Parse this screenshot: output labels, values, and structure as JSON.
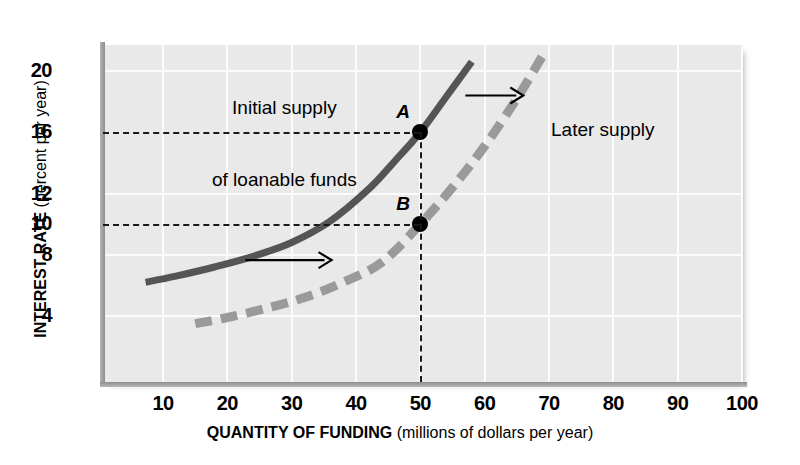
{
  "chart_data": {
    "type": "line",
    "title": "",
    "xlabel_bold": "QUANTITY OF FUNDING",
    "xlabel_rest": " (millions of dollars per year)",
    "ylabel_bold": "INTEREST RATE",
    "ylabel_rest": " (percent per year)",
    "xlim": [
      0,
      100
    ],
    "ylim": [
      0,
      22
    ],
    "xticks": [
      10,
      20,
      30,
      40,
      50,
      60,
      70,
      80,
      90,
      100
    ],
    "yticks": [
      20,
      16,
      12,
      10,
      8,
      4
    ],
    "y_gridlines": [
      20,
      12,
      8,
      4
    ],
    "x_gridlines": [
      10,
      20,
      30,
      40,
      50,
      60,
      70,
      80,
      90,
      100
    ],
    "grid": true,
    "legend": "none",
    "series": [
      {
        "name": "Initial supply of loanable funds",
        "style": "solid",
        "color": "#555555",
        "points": [
          {
            "x": 7.3,
            "y": 6.2
          },
          {
            "x": 12,
            "y": 6.6
          },
          {
            "x": 18,
            "y": 7.2
          },
          {
            "x": 24,
            "y": 7.9
          },
          {
            "x": 30,
            "y": 8.8
          },
          {
            "x": 36,
            "y": 10.2
          },
          {
            "x": 42,
            "y": 12.3
          },
          {
            "x": 46,
            "y": 14.1
          },
          {
            "x": 50,
            "y": 16.0
          },
          {
            "x": 54,
            "y": 18.3
          },
          {
            "x": 58,
            "y": 20.6
          }
        ]
      },
      {
        "name": "Later supply",
        "style": "dashed",
        "color": "#9a9a9a",
        "points": [
          {
            "x": 15,
            "y": 3.5
          },
          {
            "x": 20,
            "y": 3.9
          },
          {
            "x": 26,
            "y": 4.5
          },
          {
            "x": 32,
            "y": 5.2
          },
          {
            "x": 38,
            "y": 6.2
          },
          {
            "x": 44,
            "y": 7.5
          },
          {
            "x": 50,
            "y": 10.0
          },
          {
            "x": 55,
            "y": 12.4
          },
          {
            "x": 60,
            "y": 15.1
          },
          {
            "x": 65,
            "y": 18.2
          },
          {
            "x": 69,
            "y": 21.0
          }
        ]
      }
    ],
    "points_marked": [
      {
        "label": "A",
        "x": 50,
        "y": 16
      },
      {
        "label": "B",
        "x": 50,
        "y": 10
      }
    ],
    "guide_lines": [
      {
        "type": "horizontal",
        "y": 16,
        "from_x": 0,
        "to_x": 50
      },
      {
        "type": "horizontal",
        "y": 10,
        "from_x": 0,
        "to_x": 50
      },
      {
        "type": "vertical",
        "x": 50,
        "from_y": 0,
        "to_y": 16
      }
    ],
    "annotations": [
      {
        "id": "initial-supply",
        "line1": "Initial supply",
        "line2": "of loanable funds"
      },
      {
        "id": "later-supply",
        "line1": "Later supply",
        "line2": ""
      }
    ],
    "arrows": [
      {
        "id": "shift-arrow-top",
        "from_x": 57,
        "from_y": 18.4,
        "to_x": 66,
        "to_y": 18.4
      },
      {
        "id": "shift-arrow-bottom",
        "from_x": 22.8,
        "from_y": 7.65,
        "to_x": 36.2,
        "to_y": 7.65
      }
    ]
  }
}
